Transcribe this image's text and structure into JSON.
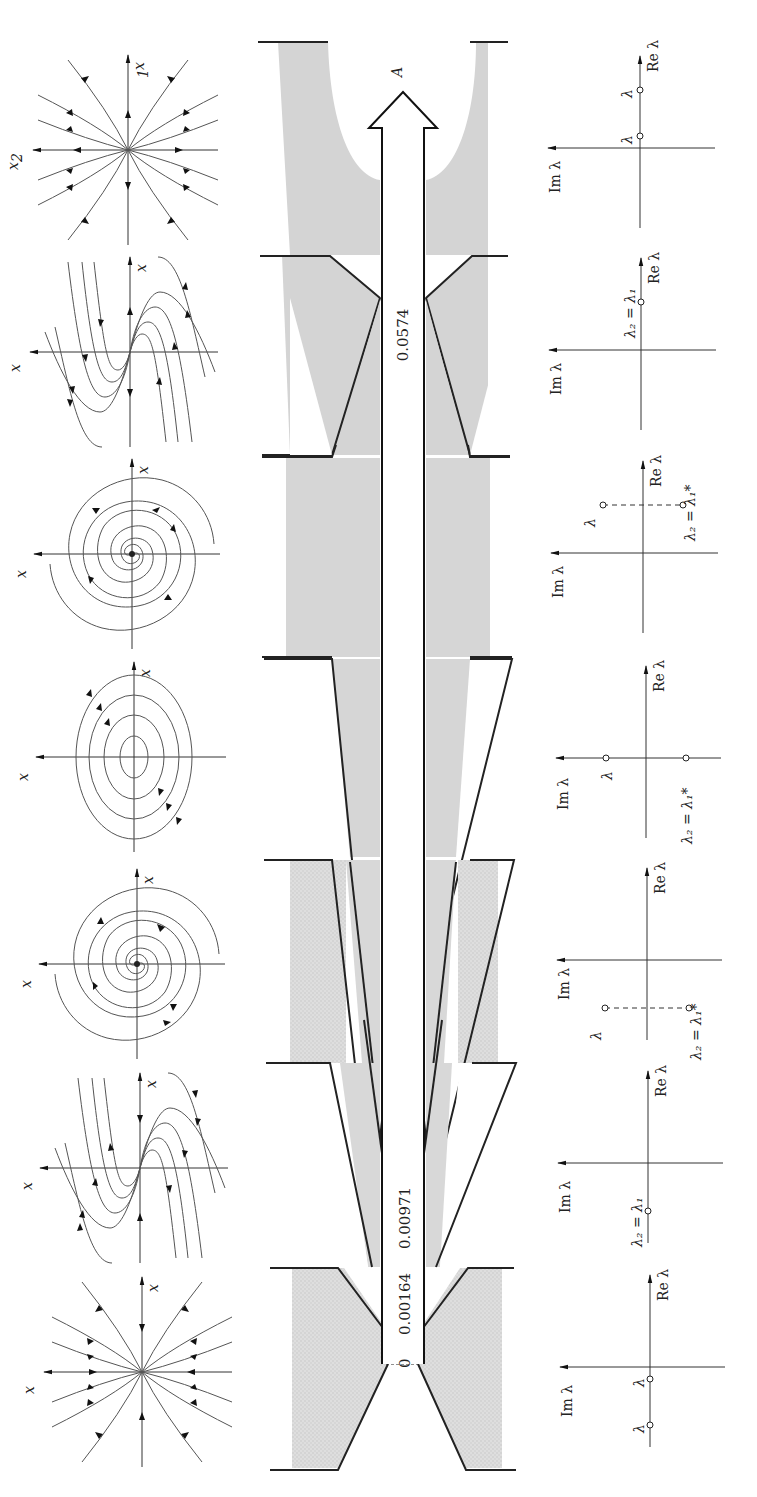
{
  "figure": {
    "orientation": "rotated-90-ccw",
    "parameter_axis": {
      "label": "A",
      "values": [
        "0",
        "0.00164",
        "0.00971",
        "0.0574"
      ]
    },
    "rows": [
      {
        "regime": "unstable node",
        "phase_portrait": {
          "x1_label": "x1",
          "x2_label": "x2",
          "type": "node"
        },
        "eigen_plane": {
          "re_label": "Re λ",
          "im_label": "Im λ",
          "point_labels": [
            "λ1",
            "λ2"
          ],
          "config": "two real positive"
        }
      },
      {
        "regime": "unstable degenerate node",
        "phase_portrait": {
          "x1_label": "x1",
          "x2_label": "x2",
          "type": "degenerate-node"
        },
        "eigen_plane": {
          "re_label": "Re λ",
          "im_label": "Im λ",
          "point_labels": [
            "λ2 = λ1"
          ],
          "config": "double real positive"
        }
      },
      {
        "regime": "unstable focus",
        "phase_portrait": {
          "x1_label": "x1",
          "x2_label": "x2",
          "type": "spiral"
        },
        "eigen_plane": {
          "re_label": "Re λ",
          "im_label": "Im λ",
          "point_labels": [
            "λ1",
            "λ2 = λ1*"
          ],
          "config": "complex, positive real part"
        }
      },
      {
        "regime": "center",
        "phase_portrait": {
          "x1_label": "x1",
          "x2_label": "x2",
          "type": "center"
        },
        "eigen_plane": {
          "re_label": "Re λ",
          "im_label": "Im λ",
          "point_labels": [
            "λ1",
            "λ2 = λ1*"
          ],
          "config": "pure imaginary"
        }
      },
      {
        "regime": "stable focus",
        "phase_portrait": {
          "x1_label": "x1",
          "x2_label": "x2",
          "type": "spiral"
        },
        "eigen_plane": {
          "re_label": "Re λ",
          "im_label": "Im λ",
          "point_labels": [
            "λ1",
            "λ2 = λ1*"
          ],
          "config": "complex, negative real part"
        }
      },
      {
        "regime": "stable degenerate node",
        "phase_portrait": {
          "x1_label": "x1",
          "x2_label": "x2",
          "type": "degenerate-node"
        },
        "eigen_plane": {
          "re_label": "Re λ",
          "im_label": "Im λ",
          "point_labels": [
            "λ2 = λ1"
          ],
          "config": "double real negative"
        }
      },
      {
        "regime": "stable node",
        "phase_portrait": {
          "x1_label": "x1",
          "x2_label": "x2",
          "type": "node"
        },
        "eigen_plane": {
          "re_label": "Re λ",
          "im_label": "Im λ",
          "point_labels": [
            "λ1",
            "λ2"
          ],
          "config": "two real negative"
        }
      }
    ]
  },
  "labels": {
    "x1": "x",
    "x1_sub": "1",
    "x2": "x",
    "x2_sub": "2",
    "re": "Re λ",
    "im": "Im λ",
    "l1": "λ",
    "l1_sub": "1",
    "l2": "λ",
    "l2_sub": "2",
    "eq_double": "λ₂ = λ₁",
    "eq_conj": "λ₂ = λ₁*",
    "A": "A",
    "v0": "0",
    "v1": "0.00164",
    "v2": "0.00971",
    "v3": "0.0574"
  },
  "colors": {
    "shade": "#d6d6d6",
    "shade_dark": "#c8c8c8",
    "ink": "#222222",
    "traj": "#555555"
  }
}
